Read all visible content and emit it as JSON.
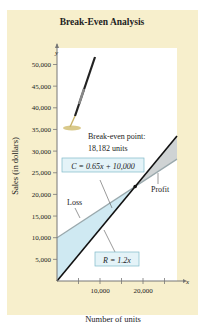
{
  "chart_data": {
    "type": "line",
    "title": "Break-Even Analysis",
    "xlabel": "Number of units",
    "ylabel": "Sales (in dollars)",
    "x_axis_symbol": "x",
    "y_axis_symbol": "y",
    "xlim": [
      0,
      30000
    ],
    "ylim": [
      0,
      52000
    ],
    "x_ticks": [
      5000,
      10000,
      15000,
      20000,
      25000
    ],
    "x_tick_labels": [
      "",
      "10,000",
      "",
      "20,000",
      ""
    ],
    "y_ticks": [
      5000,
      10000,
      15000,
      20000,
      25000,
      30000,
      35000,
      40000,
      45000,
      50000
    ],
    "y_tick_labels": [
      "5,000",
      "10,000",
      "15,000",
      "20,000",
      "25,000",
      "30,000",
      "35,000",
      "40,000",
      "45,000",
      "50,000"
    ],
    "grid": false,
    "series": [
      {
        "name": "C = 0.65x + 10,000",
        "slope": 0.65,
        "intercept": 10000,
        "color": "#9aa9ad"
      },
      {
        "name": "R = 1.2x",
        "slope": 1.2,
        "intercept": 0,
        "color": "#111111"
      }
    ],
    "break_even_point": {
      "x": 18182,
      "y": 21818
    },
    "regions": [
      {
        "name": "Loss",
        "color": "#cfe9f2"
      },
      {
        "name": "Profit",
        "color": "#cfd3d4"
      }
    ],
    "annotations": {
      "break_even_line1": "Break-even point:",
      "break_even_line2": "18,182 units",
      "cost_label": "C = 0.65x + 10,000",
      "revenue_label": "R = 1.2x",
      "loss_label": "Loss",
      "profit_label": "Profit"
    }
  }
}
